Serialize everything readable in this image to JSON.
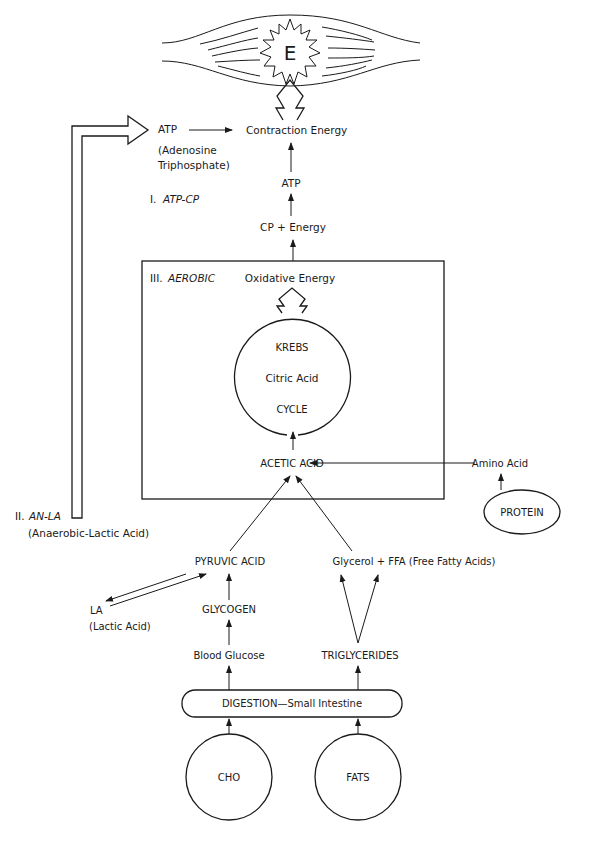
{
  "muscle": {
    "energy_symbol": "E"
  },
  "top": {
    "atp_label": "ATP",
    "atp_full_line1": "(Adenosine",
    "atp_full_line2": "Triphosphate)",
    "contraction_energy": "Contraction Energy",
    "atp_center": "ATP",
    "cp_energy": "CP + Energy"
  },
  "systems": {
    "atp_cp_num": "I.",
    "atp_cp": "ATP-CP",
    "an_la_num": "II.",
    "an_la": "AN-LA",
    "an_la_full": "(Anaerobic-Lactic Acid)",
    "aerobic_num": "III.",
    "aerobic": "AEROBIC"
  },
  "aerobic_box": {
    "oxidative_energy": "Oxidative Energy",
    "krebs_line1": "KREBS",
    "krebs_line2": "Citric Acid",
    "krebs_line3": "CYCLE",
    "acetic_acid": "ACETIC ACID"
  },
  "protein_path": {
    "amino_acid": "Amino Acid",
    "protein": "PROTEIN"
  },
  "carb_path": {
    "pyruvic_acid": "PYRUVIC ACID",
    "la": "LA",
    "la_full": "(Lactic Acid)",
    "glycogen": "GLYCOGEN",
    "blood_glucose": "Blood Glucose"
  },
  "fat_path": {
    "glycerol_ffa": "Glycerol + FFA (Free Fatty Acids)",
    "triglycerides": "TRIGLYCERIDES"
  },
  "digestion": {
    "label": "DIGESTION—Small Intestine"
  },
  "sources": {
    "cho": "CHO",
    "fats": "FATS"
  }
}
